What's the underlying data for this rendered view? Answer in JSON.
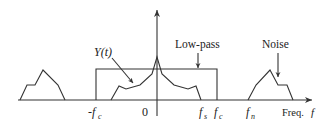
{
  "diagram": {
    "type": "frequency-spectrum",
    "labels": {
      "signal": "Y(t)",
      "filter": "Low-pass",
      "noise": "Noise",
      "neg_cutoff": "-f",
      "neg_cutoff_sub": "c",
      "origin": "0",
      "signal_freq": "f",
      "signal_freq_sub": "s",
      "cutoff": "f",
      "cutoff_sub": "c",
      "noise_freq": "f",
      "noise_freq_sub": "n",
      "axis_label": "Freq. ",
      "axis_label_var": "f"
    },
    "colors": {
      "line": "#333333",
      "text": "#222222"
    }
  }
}
